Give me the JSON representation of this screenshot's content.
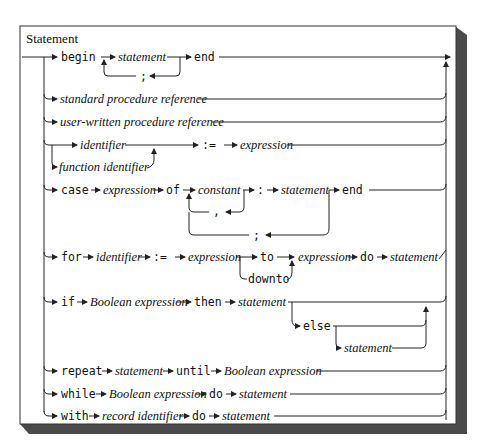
{
  "title": "Statement",
  "colors": {
    "background": "#ffffff",
    "line": "#222222",
    "shadow": "#4a4a4a",
    "border": "#333333"
  },
  "rows": {
    "begin": {
      "kw_begin": "begin",
      "statement": "statement",
      "kw_end": "end",
      "sep": ";"
    },
    "standard_proc": {
      "label": "standard procedure reference"
    },
    "user_proc": {
      "label": "user-written procedure reference"
    },
    "assignment": {
      "identifier": "identifier",
      "function_identifier": "function identifier",
      "assign": ":=",
      "expression": "expression"
    },
    "case": {
      "kw_case": "case",
      "expression": "expression",
      "kw_of": "of",
      "constant": "constant",
      "colon": ":",
      "statement": "statement",
      "kw_end": "end",
      "comma": ",",
      "semicolon": ";"
    },
    "for": {
      "kw_for": "for",
      "identifier": "identifier",
      "assign": ":=",
      "expression1": "expression",
      "kw_to": "to",
      "kw_downto": "downto",
      "expression2": "expression",
      "kw_do": "do",
      "statement": "statement"
    },
    "if": {
      "kw_if": "if",
      "condition": "Boolean expression",
      "kw_then": "then",
      "statement": "statement",
      "kw_else": "else",
      "else_statement": "statement"
    },
    "repeat": {
      "kw_repeat": "repeat",
      "statement": "statement",
      "kw_until": "until",
      "condition": "Boolean expression"
    },
    "while": {
      "kw_while": "while",
      "condition": "Boolean expression",
      "kw_do": "do",
      "statement": "statement"
    },
    "with": {
      "kw_with": "with",
      "record": "record identifier",
      "kw_do": "do",
      "statement": "statement"
    }
  }
}
